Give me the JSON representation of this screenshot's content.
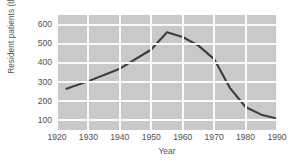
{
  "chart_data": {
    "type": "line",
    "title": "",
    "xlabel": "Year",
    "ylabel": "Resident patients (thousands)",
    "xlim": [
      1920,
      1990
    ],
    "ylim": [
      50,
      650
    ],
    "grid": true,
    "legend": null,
    "xticks": [
      1920,
      1930,
      1940,
      1950,
      1960,
      1970,
      1980,
      1990
    ],
    "yticks": [
      100,
      200,
      300,
      400,
      500,
      600
    ],
    "series": [
      {
        "name": "Resident patients",
        "color": "#3d3d3d",
        "x": [
          1923,
          1930,
          1940,
          1950,
          1955,
          1960,
          1965,
          1970,
          1975,
          1980,
          1985,
          1990
        ],
        "values": [
          265,
          305,
          370,
          470,
          560,
          535,
          490,
          420,
          270,
          170,
          130,
          110
        ]
      }
    ]
  },
  "axes": {
    "y_title": "Resident patients (thousands)",
    "x_title": "Year",
    "y_tick_labels": [
      "600",
      "500",
      "400",
      "300",
      "200",
      "100"
    ],
    "x_tick_labels": [
      "1920",
      "1930",
      "1940",
      "1950",
      "1960",
      "1970",
      "1980",
      "1990"
    ]
  },
  "style": {
    "plot_background": "#c9c9c9",
    "grid_color": "#fafafa",
    "line_color": "#3d3d3d",
    "text_color": "#4f4f4f",
    "page_background": "#ffffff"
  }
}
